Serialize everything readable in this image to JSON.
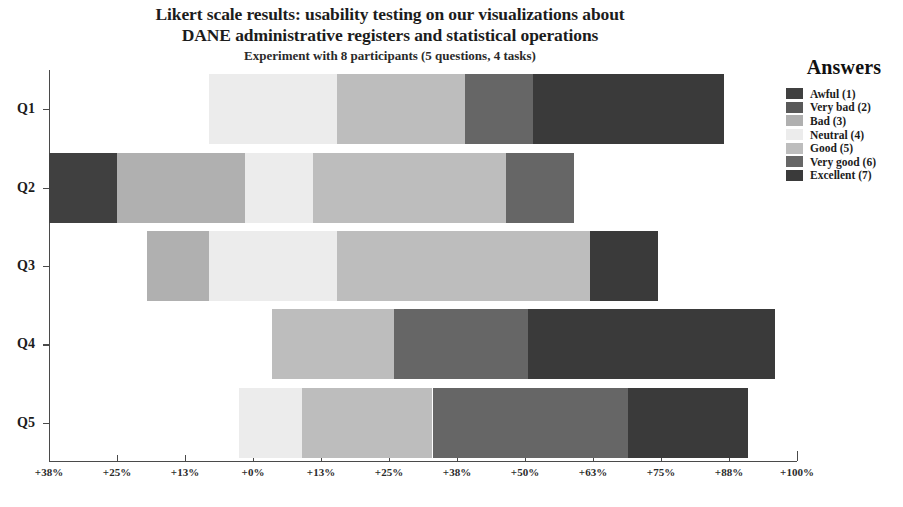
{
  "header": {
    "title_lines": [
      "Likert scale results: usability testing on our visualizations about",
      "DANE administrative registers and statistical operations"
    ],
    "subtitle": "Experiment with 8 participants (5 questions, 4 tasks)"
  },
  "legend": {
    "title": "Answers",
    "position": "right",
    "items": [
      {
        "label": "Awful (1)",
        "color": "#404040"
      },
      {
        "label": "Very bad (2)",
        "color": "#595959"
      },
      {
        "label": "Bad (3)",
        "color": "#b0b0b0"
      },
      {
        "label": "Neutral (4)",
        "color": "#ececec"
      },
      {
        "label": "Good (5)",
        "color": "#bdbdbd"
      },
      {
        "label": "Very good (6)",
        "color": "#666666"
      },
      {
        "label": "Excellent (7)",
        "color": "#3a3a3a"
      }
    ]
  },
  "chart_data": {
    "type": "bar",
    "subtype": "diverging-stacked-likert",
    "orientation": "horizontal",
    "title": "Likert scale results: usability testing on our visualizations about DANE administrative registers and statistical operations",
    "subtitle": "Experiment with 8 participants (5 questions, 4 tasks)",
    "xlabel": "",
    "ylabel": "",
    "grid": false,
    "legend_position": "right",
    "categories": [
      "Q1",
      "Q2",
      "Q3",
      "Q4",
      "Q5"
    ],
    "xticklabels": [
      "+38%",
      "+25%",
      "+13%",
      "+0%",
      "+13%",
      "+25%",
      "+38%",
      "+50%",
      "+63%",
      "+75%",
      "+88%",
      "+100%"
    ],
    "xtickvalues": [
      -37.5,
      -25,
      -12.5,
      0,
      12.5,
      25,
      37.5,
      50,
      62.5,
      75,
      87.5,
      100
    ],
    "xlim": [
      -37.5,
      100
    ],
    "zero_at": 0,
    "series": [
      {
        "name": "Awful (1)",
        "color": "#404040",
        "values": [
          0,
          12.5,
          0,
          0,
          0
        ]
      },
      {
        "name": "Very bad (2)",
        "color": "#595959",
        "values": [
          0,
          0,
          0,
          0,
          0
        ]
      },
      {
        "name": "Bad (3)",
        "color": "#b0b0b0",
        "values": [
          0,
          23.5,
          11.5,
          0,
          0
        ]
      },
      {
        "name": "Neutral (4)",
        "color": "#ececec",
        "values": [
          23.5,
          12.5,
          23.5,
          0,
          11.5
        ]
      },
      {
        "name": "Good (5)",
        "color": "#bdbdbd",
        "values": [
          23.5,
          35.5,
          46.5,
          22.5,
          24.0
        ]
      },
      {
        "name": "Very good (6)",
        "color": "#666666",
        "values": [
          12.5,
          12.5,
          0,
          24.5,
          36.0
        ]
      },
      {
        "name": "Excellent (7)",
        "color": "#3a3a3a",
        "values": [
          35.0,
          0,
          12.5,
          45.5,
          22.0
        ]
      }
    ],
    "bars": [
      {
        "category": "Q1",
        "start_percent": -8.0,
        "segments": [
          {
            "name": "Neutral (4)",
            "color": "#ececec",
            "width_percent": 23.5
          },
          {
            "name": "Good (5)",
            "color": "#bdbdbd",
            "width_percent": 23.5
          },
          {
            "name": "Very good (6)",
            "color": "#666666",
            "width_percent": 12.5
          },
          {
            "name": "Excellent (7)",
            "color": "#3a3a3a",
            "width_percent": 35.0
          }
        ]
      },
      {
        "category": "Q2",
        "start_percent": -37.5,
        "segments": [
          {
            "name": "Awful (1)",
            "color": "#404040",
            "width_percent": 12.5
          },
          {
            "name": "Bad (3)",
            "color": "#b0b0b0",
            "width_percent": 23.5
          },
          {
            "name": "Neutral (4)",
            "color": "#ececec",
            "width_percent": 12.5
          },
          {
            "name": "Good (5)",
            "color": "#bdbdbd",
            "width_percent": 35.5
          },
          {
            "name": "Very good (6)",
            "color": "#666666",
            "width_percent": 12.5
          }
        ]
      },
      {
        "category": "Q3",
        "start_percent": -19.5,
        "segments": [
          {
            "name": "Bad (3)",
            "color": "#b0b0b0",
            "width_percent": 11.5
          },
          {
            "name": "Neutral (4)",
            "color": "#ececec",
            "width_percent": 23.5
          },
          {
            "name": "Good (5)",
            "color": "#bdbdbd",
            "width_percent": 46.5
          },
          {
            "name": "Excellent (7)",
            "color": "#3a3a3a",
            "width_percent": 12.5
          }
        ]
      },
      {
        "category": "Q4",
        "start_percent": 3.5,
        "segments": [
          {
            "name": "Good (5)",
            "color": "#bdbdbd",
            "width_percent": 22.5
          },
          {
            "name": "Very good (6)",
            "color": "#666666",
            "width_percent": 24.5
          },
          {
            "name": "Excellent (7)",
            "color": "#3a3a3a",
            "width_percent": 45.5
          }
        ]
      },
      {
        "category": "Q5",
        "start_percent": -2.5,
        "segments": [
          {
            "name": "Neutral (4)",
            "color": "#ececec",
            "width_percent": 11.5
          },
          {
            "name": "Good (5)",
            "color": "#bdbdbd",
            "width_percent": 24.0
          },
          {
            "name": "Very good (6)",
            "color": "#666666",
            "width_percent": 36.0
          },
          {
            "name": "Excellent (7)",
            "color": "#3a3a3a",
            "width_percent": 22.0
          }
        ]
      }
    ]
  }
}
